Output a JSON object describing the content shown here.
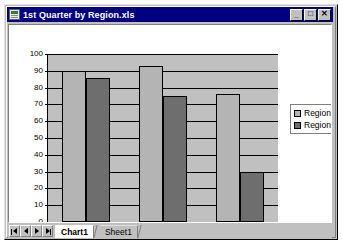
{
  "window": {
    "title": "1st Quarter by Region.xls",
    "icon": "excel-workbook-icon",
    "buttons": {
      "minimize": "_",
      "maximize": "□",
      "close": "✕"
    }
  },
  "sheet_tabs": {
    "nav": {
      "first": "first-sheet",
      "prev": "previous-sheet",
      "next": "next-sheet",
      "last": "last-sheet"
    },
    "tabs": [
      {
        "label": "Chart1",
        "active": true
      },
      {
        "label": "Sheet1",
        "active": false
      }
    ]
  },
  "colors": {
    "series1": "#b4b4b4",
    "series2": "#6e6e6e",
    "plot_background": "#c0c0c0",
    "titlebar": "#000080",
    "window_face": "#c0c0c0"
  },
  "chart_data": {
    "type": "bar",
    "title": "",
    "xlabel": "",
    "ylabel": "",
    "categories": [
      "January",
      "February",
      "March"
    ],
    "series": [
      {
        "name": "Region 1",
        "values": [
          90,
          93,
          76
        ],
        "color": "#b4b4b4"
      },
      {
        "name": "Region 2",
        "values": [
          86,
          75,
          30
        ],
        "color": "#6e6e6e"
      }
    ],
    "ylim": [
      0,
      100
    ],
    "ytick_labels": [
      "100",
      "90",
      "80",
      "70",
      "60",
      "50",
      "40",
      "30",
      "20",
      "10",
      "0"
    ],
    "ytick_values": [
      100,
      90,
      80,
      70,
      60,
      50,
      40,
      30,
      20,
      10,
      0
    ],
    "grid": true,
    "legend_position": "right",
    "legend_entries": [
      "Region 1",
      "Region 2"
    ]
  }
}
